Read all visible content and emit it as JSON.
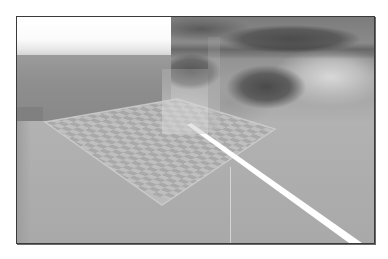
{
  "viewport": {
    "label": "3D scene render",
    "colors": {
      "border": "#3a3a3a",
      "sky": "#ffffff",
      "wall": "#8e8e8e",
      "floor": "#adadad",
      "checker_light": "#c2c2c2",
      "checker_dark": "#9a9a9a",
      "laser": "#ffffff"
    },
    "objects": [
      {
        "name": "sky-gradient"
      },
      {
        "name": "rock-backdrop"
      },
      {
        "name": "floor-plane"
      },
      {
        "name": "checkerboard-quad",
        "grid": "12x12"
      },
      {
        "name": "translucent-panel"
      },
      {
        "name": "laser-beam"
      }
    ]
  }
}
